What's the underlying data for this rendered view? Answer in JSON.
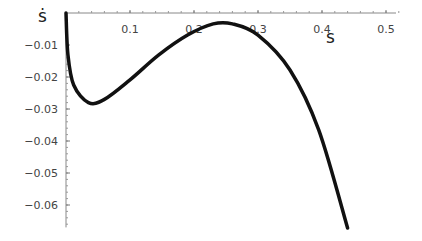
{
  "chart_data": {
    "type": "line",
    "title": "",
    "xlabel": "s",
    "ylabel": "ṡ",
    "xlim": [
      0,
      0.5
    ],
    "ylim": [
      -0.067,
      0.0
    ],
    "grid": false,
    "legend": null,
    "x_ticks": [
      "0.1",
      "0.2",
      "0.3",
      "0.4",
      "0.5"
    ],
    "y_ticks": [
      "-0.01",
      "-0.02",
      "-0.03",
      "-0.04",
      "-0.05",
      "-0.06"
    ],
    "series": [
      {
        "name": "s-dot vs s",
        "x": [
          0.0,
          0.003,
          0.012,
          0.035,
          0.06,
          0.1,
          0.145,
          0.19,
          0.23,
          0.26,
          0.3,
          0.35,
          0.395,
          0.44
        ],
        "y": [
          0.0,
          -0.013,
          -0.0225,
          -0.028,
          -0.027,
          -0.0209,
          -0.0131,
          -0.0069,
          -0.0034,
          -0.0034,
          -0.0069,
          -0.0178,
          -0.0366,
          -0.0672
        ]
      }
    ]
  },
  "axes": {
    "x_title": "s",
    "y_title": "ṡ"
  }
}
